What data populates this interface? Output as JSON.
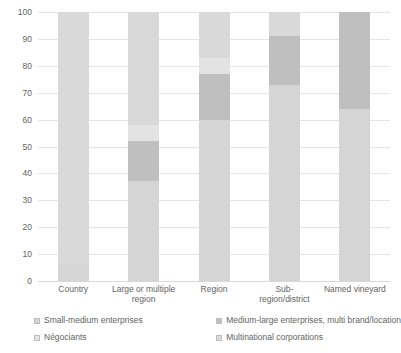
{
  "chart_data": {
    "type": "bar",
    "stacked": true,
    "title": "",
    "xlabel": "",
    "ylabel": "",
    "ylim": [
      0,
      100
    ],
    "ytick_step": 10,
    "ytick_labels": [
      "100",
      "90",
      "80",
      "70",
      "60",
      "50",
      "40",
      "30",
      "20",
      "10",
      "0"
    ],
    "ytick_values": [
      100,
      90,
      80,
      70,
      60,
      50,
      40,
      30,
      20,
      10,
      0
    ],
    "grid": true,
    "legend_position": "bottom",
    "categories": [
      "Country",
      "Large or multiple region",
      "Region",
      "Sub-region/district",
      "Named vineyard"
    ],
    "series": [
      {
        "name": "Small-medium enterprises",
        "color": "#d5d5d5",
        "values": [
          6,
          37,
          60,
          73,
          64
        ]
      },
      {
        "name": "Medium-large enterprises, multi brand/location",
        "color": "#bfbfbf",
        "values": [
          0,
          15,
          17,
          18,
          36
        ]
      },
      {
        "name": "Négociants",
        "color": "#e3e3e3",
        "values": [
          0,
          6,
          6,
          0,
          0
        ]
      },
      {
        "name": "Multinational corporations",
        "color": "#d9d9d9",
        "values": [
          94,
          42,
          17,
          9,
          0
        ]
      }
    ],
    "legend": [
      {
        "label": "Small-medium enterprises",
        "color": "#d5d5d5"
      },
      {
        "label": "Medium-large enterprises, multi brand/location",
        "color": "#bfbfbf"
      },
      {
        "label": "Négociants",
        "color": "#e3e3e3"
      },
      {
        "label": "Multinational corporations",
        "color": "#d9d9d9"
      }
    ]
  }
}
